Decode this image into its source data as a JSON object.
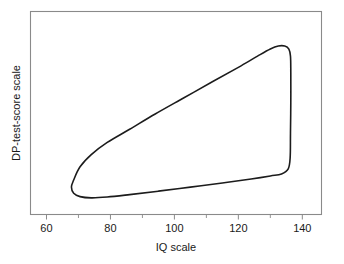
{
  "chart_data": {
    "type": "line",
    "title": "",
    "xlabel": "IQ scale",
    "ylabel": "DP-test-score scale",
    "xlim": [
      55,
      146
    ],
    "ylim": [
      0,
      100
    ],
    "grid": false,
    "legend": null,
    "x_major_ticks": [
      60,
      80,
      100,
      120,
      140
    ],
    "x_major_tick_labels": [
      "60",
      "80",
      "100",
      "120",
      "140"
    ],
    "x_minor_ticks": [
      70,
      90,
      110,
      130
    ],
    "y_major_ticks": [],
    "y_major_tick_labels": [],
    "y_minor_ticks": [],
    "series": [
      {
        "name": "scatter envelope boundary",
        "closed": true,
        "points": [
          [
            68.5,
            17.0
          ],
          [
            70.5,
            23.5
          ],
          [
            74.0,
            29.5
          ],
          [
            79.0,
            35.5
          ],
          [
            86.0,
            42.0
          ],
          [
            94.0,
            49.5
          ],
          [
            103.0,
            57.5
          ],
          [
            112.0,
            65.5
          ],
          [
            120.0,
            72.5
          ],
          [
            126.0,
            78.0
          ],
          [
            130.0,
            81.5
          ],
          [
            132.5,
            83.0
          ],
          [
            134.5,
            83.0
          ],
          [
            135.8,
            81.5
          ],
          [
            136.3,
            78.0
          ],
          [
            136.4,
            70.0
          ],
          [
            136.4,
            55.0
          ],
          [
            136.3,
            40.0
          ],
          [
            136.2,
            28.0
          ],
          [
            135.6,
            22.5
          ],
          [
            133.5,
            20.0
          ],
          [
            130.0,
            19.0
          ],
          [
            124.0,
            17.5
          ],
          [
            115.0,
            15.5
          ],
          [
            105.0,
            13.5
          ],
          [
            95.0,
            11.5
          ],
          [
            86.0,
            9.8
          ],
          [
            79.0,
            8.6
          ],
          [
            74.0,
            8.2
          ],
          [
            70.5,
            8.8
          ],
          [
            68.5,
            10.5
          ],
          [
            67.8,
            13.5
          ],
          [
            68.5,
            17.0
          ]
        ]
      }
    ],
    "annotations": [],
    "colors": {
      "curve": "#1c1c1c",
      "frame": "#8a8a8a",
      "background": "#ffffff",
      "text": "#1a1a1a"
    }
  },
  "axes": {
    "x_title": "IQ scale",
    "y_title": "DP-test-score scale"
  }
}
